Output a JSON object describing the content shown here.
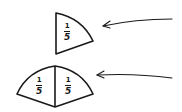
{
  "diagram": {
    "top_shape": {
      "label": {
        "numerator": "1",
        "denominator": "5"
      },
      "pieces": 1
    },
    "bottom_shape": {
      "labels": [
        {
          "numerator": "1",
          "denominator": "5"
        },
        {
          "numerator": "1",
          "denominator": "5"
        }
      ],
      "pieces": 2
    },
    "arrows": [
      {
        "points_to": "top_shape"
      },
      {
        "points_to": "bottom_shape"
      }
    ],
    "colors": {
      "stroke": "#1a1a1a",
      "background": "#ffffff"
    }
  }
}
